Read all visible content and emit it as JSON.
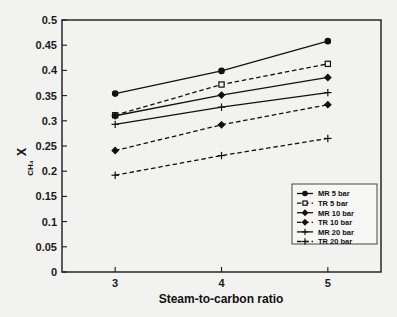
{
  "figure": {
    "background_color": "#f2f2f0",
    "ink_color": "#111111"
  },
  "chart_data": {
    "type": "line",
    "title": "",
    "xlabel": "Steam-to-carbon ratio",
    "ylabel": "X_CH4",
    "ylabel_base": "X",
    "ylabel_subscript": "CH₄",
    "x": [
      3,
      4,
      5
    ],
    "xtick_labels": [
      "3",
      "4",
      "5"
    ],
    "xlim": [
      2.5,
      5.5
    ],
    "ylim": [
      0,
      0.5
    ],
    "ytick_labels": [
      "0",
      "0.05",
      "0.1",
      "0.15",
      "0.2",
      "0.25",
      "0.3",
      "0.35",
      "0.4",
      "0.45",
      "0.5"
    ],
    "ytick_values": [
      0,
      0.05,
      0.1,
      0.15,
      0.2,
      0.25,
      0.3,
      0.35,
      0.4,
      0.45,
      0.5
    ],
    "grid": false,
    "legend_position": "lower right",
    "series": [
      {
        "name": "MR 5 bar",
        "values": [
          0.354,
          0.399,
          0.458
        ],
        "style": "solid",
        "marker": "circle-filled"
      },
      {
        "name": "TR 5 bar",
        "values": [
          0.311,
          0.372,
          0.413
        ],
        "style": "dashed",
        "marker": "square-hollow"
      },
      {
        "name": "MR 10 bar",
        "values": [
          0.31,
          0.351,
          0.386
        ],
        "style": "solid",
        "marker": "diamond-filled"
      },
      {
        "name": "TR 10 bar",
        "values": [
          0.241,
          0.292,
          0.332
        ],
        "style": "dashed",
        "marker": "diamond-filled"
      },
      {
        "name": "MR 20 bar",
        "values": [
          0.293,
          0.327,
          0.356
        ],
        "style": "solid",
        "marker": "plus"
      },
      {
        "name": "TR 20 bar",
        "values": [
          0.192,
          0.231,
          0.265
        ],
        "style": "dashed",
        "marker": "plus"
      }
    ]
  },
  "legend": {
    "entries": [
      {
        "label": "MR 5 bar"
      },
      {
        "label": "TR 5 bar"
      },
      {
        "label": "MR 10 bar"
      },
      {
        "label": "TR 10 bar"
      },
      {
        "label": "MR 20 bar"
      },
      {
        "label": "TR 20 bar"
      }
    ]
  }
}
